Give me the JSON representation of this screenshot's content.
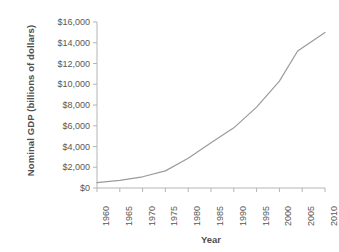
{
  "chart_data": {
    "type": "line",
    "title": "",
    "xlabel": "Year",
    "ylabel": "Nominal GDP (billions of dollars)",
    "xlim": [
      1960,
      2010
    ],
    "ylim": [
      0,
      16000
    ],
    "grid": false,
    "legend": false,
    "x_tick_labels": [
      "1960",
      "1965",
      "1970",
      "1975",
      "1980",
      "1985",
      "1990",
      "1995",
      "2000",
      "2005",
      "2010"
    ],
    "y_tick_labels": [
      "$0",
      "$2,000",
      "$4,000",
      "$6,000",
      "$8,000",
      "$10,000",
      "$12,000",
      "$14,000",
      "$16,000"
    ],
    "y_tick_values": [
      0,
      2000,
      4000,
      6000,
      8000,
      10000,
      12000,
      14000,
      16000
    ],
    "x": [
      1960,
      1965,
      1970,
      1975,
      1980,
      1985,
      1990,
      1995,
      2000,
      2004,
      2010
    ],
    "values": [
      520,
      740,
      1080,
      1650,
      2860,
      4350,
      5800,
      7800,
      10300,
      13200,
      15000
    ],
    "series": [
      {
        "name": "Nominal GDP",
        "color": "#9b9b9b",
        "values": [
          520,
          740,
          1080,
          1650,
          2860,
          4350,
          5800,
          7800,
          10300,
          13200,
          15000
        ]
      }
    ],
    "line_color": "#9b9b9b",
    "axis_color": "#b5b5b5",
    "text_color": "#585858"
  }
}
